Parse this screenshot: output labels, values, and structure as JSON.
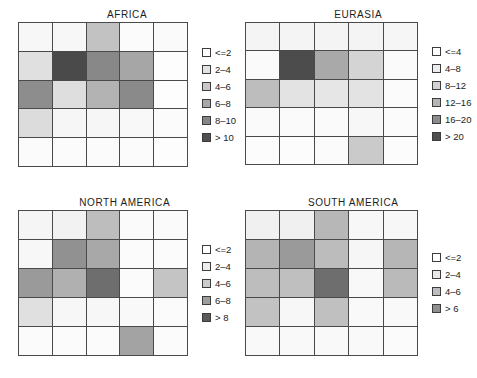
{
  "figure": {
    "background": "#ffffff",
    "grid_line_color": "#4a4a4a"
  },
  "chart_data": [
    {
      "type": "heatmap",
      "title": "AFRICA",
      "rows": 5,
      "cols": 5,
      "bins": [
        "<=2",
        "2–4",
        "4–6",
        "6–8",
        "8–10",
        "> 10"
      ],
      "bin_colors": [
        "#ffffff",
        "#e3e3e3",
        "#c8c8c8",
        "#a8a8a8",
        "#858585",
        "#4f4f4f"
      ],
      "values": [
        [
          0,
          0,
          2,
          0,
          0
        ],
        [
          1,
          5,
          4,
          3,
          0
        ],
        [
          4,
          1,
          3,
          4,
          0
        ],
        [
          1,
          0,
          0,
          0,
          0
        ],
        [
          0,
          0,
          0,
          0,
          0
        ]
      ],
      "legend_position": "right",
      "xlabel": "",
      "ylabel": ""
    },
    {
      "type": "heatmap",
      "title": "EURASIA",
      "rows": 5,
      "cols": 5,
      "bins": [
        "<=4",
        "4–8",
        "8–12",
        "12–16",
        "16–20",
        "> 20"
      ],
      "bin_colors": [
        "#ffffff",
        "#ededed",
        "#d2d2d2",
        "#b4b4b4",
        "#8c8c8c",
        "#4f4f4f"
      ],
      "values": [
        [
          1,
          1,
          1,
          1,
          1
        ],
        [
          1,
          5,
          3,
          2,
          1
        ],
        [
          3,
          2,
          2,
          2,
          1
        ],
        [
          1,
          1,
          1,
          1,
          1
        ],
        [
          0,
          0,
          1,
          2,
          0
        ]
      ],
      "legend_position": "right",
      "xlabel": "",
      "ylabel": ""
    },
    {
      "type": "heatmap",
      "title": "NORTH AMERICA",
      "rows": 5,
      "cols": 5,
      "bins": [
        "<=2",
        "2–4",
        "4–6",
        "6–8",
        "> 8"
      ],
      "bin_colors": [
        "#ffffff",
        "#ededed",
        "#cccccc",
        "#9e9e9e",
        "#5a5a5a"
      ],
      "values": [
        [
          1,
          1,
          2,
          1,
          1
        ],
        [
          1,
          3,
          2,
          1,
          1
        ],
        [
          3,
          2,
          4,
          1,
          2
        ],
        [
          2,
          1,
          1,
          1,
          1
        ],
        [
          1,
          1,
          1,
          3,
          1
        ]
      ],
      "legend_position": "right",
      "xlabel": "",
      "ylabel": ""
    },
    {
      "type": "heatmap",
      "title": "SOUTH AMERICA",
      "rows": 5,
      "cols": 5,
      "bins": [
        "<=2",
        "2–4",
        "4–6",
        "> 6"
      ],
      "bin_colors": [
        "#ffffff",
        "#e8e8e8",
        "#bdbdbd",
        "#8f8f8f",
        "#5a5a5a"
      ],
      "values": [
        [
          1,
          1,
          2,
          1,
          1
        ],
        [
          2,
          3,
          2,
          1,
          2
        ],
        [
          2,
          2,
          4,
          1,
          2
        ],
        [
          2,
          1,
          2,
          1,
          1
        ],
        [
          1,
          1,
          1,
          1,
          1
        ]
      ],
      "legend_position": "right",
      "xlabel": "",
      "ylabel": ""
    }
  ],
  "panels": [
    {
      "id": "africa",
      "title": "AFRICA",
      "legend": [
        {
          "label": "<=2",
          "color": "#ffffff"
        },
        {
          "label": "2–4",
          "color": "#e3e3e3"
        },
        {
          "label": "4–6",
          "color": "#c8c8c8"
        },
        {
          "label": "6–8",
          "color": "#a8a8a8"
        },
        {
          "label": "8–10",
          "color": "#858585"
        },
        {
          "label": "> 10",
          "color": "#4f4f4f"
        }
      ],
      "cells": [
        "#f7f7f7",
        "#f7f7f7",
        "#c2c2c2",
        "#fbfbfb",
        "#fafafa",
        "#e0e0e0",
        "#4a4a4a",
        "#888888",
        "#a6a6a6",
        "#fdfdfd",
        "#8d8d8d",
        "#dedede",
        "#b3b3b3",
        "#8a8a8a",
        "#fdfdfd",
        "#dcdcdc",
        "#f6f6f6",
        "#f6f6f6",
        "#f8f8f8",
        "#fbfbfb",
        "#fbfbfb",
        "#fbfbfb",
        "#fbfbfb",
        "#fbfbfb",
        "#fdfdfd"
      ]
    },
    {
      "id": "eurasia",
      "title": "EURASIA",
      "legend": [
        {
          "label": "<=4",
          "color": "#ffffff"
        },
        {
          "label": "4–8",
          "color": "#ededed"
        },
        {
          "label": "8–12",
          "color": "#d2d2d2"
        },
        {
          "label": "12–16",
          "color": "#b4b4b4"
        },
        {
          "label": "16–20",
          "color": "#8c8c8c"
        },
        {
          "label": "> 20",
          "color": "#4f4f4f"
        }
      ],
      "cells": [
        "#f4f4f4",
        "#f4f4f4",
        "#f4f4f4",
        "#f4f4f4",
        "#f6f6f6",
        "#fafafa",
        "#4c4c4c",
        "#a9a9a9",
        "#d4d4d4",
        "#fafafa",
        "#bdbdbd",
        "#e3e3e3",
        "#e6e6e6",
        "#e3e3e3",
        "#fbfbfb",
        "#fafafa",
        "#fafafa",
        "#fafafa",
        "#f7f7f7",
        "#fbfbfb",
        "#fcfcfc",
        "#fcfcfc",
        "#fbfbfb",
        "#cacaca",
        "#fcfcfc"
      ]
    },
    {
      "id": "north-america",
      "title": "NORTH AMERICA",
      "legend": [
        {
          "label": "<=2",
          "color": "#ffffff"
        },
        {
          "label": "2–4",
          "color": "#ededed"
        },
        {
          "label": "4–6",
          "color": "#cccccc"
        },
        {
          "label": "6–8",
          "color": "#9e9e9e"
        },
        {
          "label": "> 8",
          "color": "#5a5a5a"
        }
      ],
      "cells": [
        "#f5f5f5",
        "#f2f2f2",
        "#bdbdbd",
        "#fafafa",
        "#fafafa",
        "#f7f7f7",
        "#919191",
        "#a8a8a8",
        "#fbfbfb",
        "#fbfbfb",
        "#9a9a9a",
        "#b0b0b0",
        "#6e6e6e",
        "#fbfbfb",
        "#c4c4c4",
        "#e0e0e0",
        "#f7f7f7",
        "#f7f7f7",
        "#f9f9f9",
        "#fbfbfb",
        "#fbfbfb",
        "#fbfbfb",
        "#fbfbfb",
        "#a3a3a3",
        "#fbfbfb"
      ]
    },
    {
      "id": "south-america",
      "title": "SOUTH AMERICA",
      "legend": [
        {
          "label": "<=2",
          "color": "#ffffff"
        },
        {
          "label": "2–4",
          "color": "#e8e8e8"
        },
        {
          "label": "4–6",
          "color": "#bdbdbd"
        },
        {
          "label": "> 6",
          "color": "#8f8f8f"
        }
      ],
      "cells": [
        "#f0f0f0",
        "#f0f0f0",
        "#b7b7b7",
        "#f7f7f7",
        "#f7f7f7",
        "#b4b4b4",
        "#9a9a9a",
        "#bcbcbc",
        "#f6f6f6",
        "#b6b6b6",
        "#bdbdbd",
        "#bfbfbf",
        "#6e6e6e",
        "#f8f8f8",
        "#bababa",
        "#c2c2c2",
        "#f7f7f7",
        "#c0c0c0",
        "#f9f9f9",
        "#f9f9f9",
        "#f9f9f9",
        "#f9f9f9",
        "#f9f9f9",
        "#f9f9f9",
        "#fbfbfb"
      ]
    }
  ]
}
